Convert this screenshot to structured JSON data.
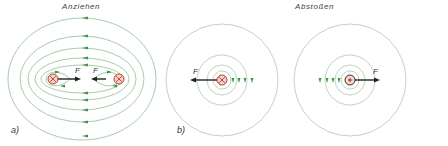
{
  "panel_a": {
    "title": "Anziehen",
    "label": "a)",
    "force_label_left": "F",
    "force_label_right": "F",
    "left_conductor": "cross-into-page",
    "right_conductor": "cross-into-page"
  },
  "panel_b": {
    "title": "Abstoßen",
    "label": "b)",
    "force_label_left": "F",
    "force_label_right": "F",
    "left_conductor": "cross-into-page",
    "right_conductor": "dot-out-of-page"
  },
  "colors": {
    "field_line": "#8fbf98",
    "outer_circle": "#bcbcbc",
    "arrowhead": "#3a9a4a",
    "conductor_fill": "#f4d2c8",
    "conductor_stroke": "#b03020",
    "force_arrow": "#222222"
  }
}
